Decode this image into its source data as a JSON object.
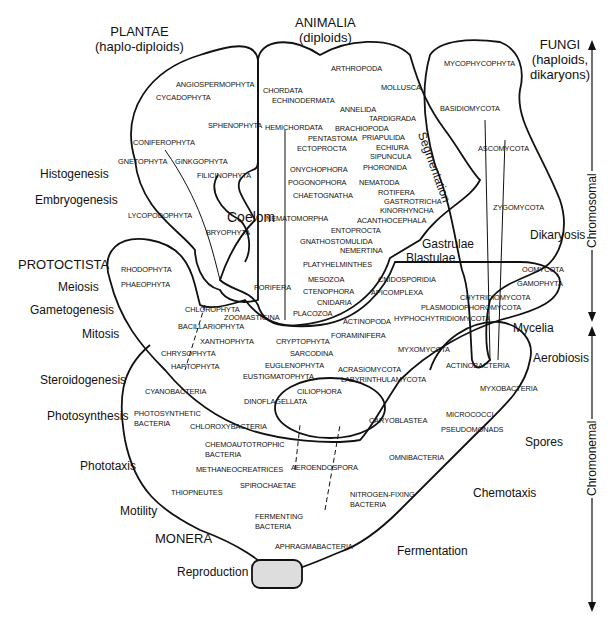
{
  "kingdoms": {
    "plantae": {
      "name": "PLANTAE",
      "ploidy": "(haplo-diploids)"
    },
    "animalia": {
      "name": "ANIMALIA",
      "ploidy": "(diploids)"
    },
    "fungi": {
      "name": "FUNGI",
      "ploidy1": "(haploids,",
      "ploidy2": "dikaryons)"
    },
    "protoctista": {
      "name": "PROTOCTISTA"
    },
    "monera": {
      "name": "MONERA"
    }
  },
  "processes_left": [
    "Histogenesis",
    "Embryogenesis",
    "Meiosis",
    "Gametogenesis",
    "Mitosis",
    "Steroidogenesis",
    "Photosynthesis",
    "Phototaxis",
    "Motility",
    "Reproduction"
  ],
  "processes_inner": {
    "coelom": "Coelom",
    "gastrulae": "Gastrulae",
    "blastulae": "Blastulae",
    "segmentation": "Segmentation",
    "dikaryosis": "Dikaryosis",
    "mycelia": "Mycelia",
    "aerobiosis": "Aerobiosis",
    "spores": "Spores",
    "chemotaxis": "Chemotaxis",
    "fermentation": "Fermentation"
  },
  "axis": {
    "upper": "Chromosomal",
    "lower": "Chromonemal"
  },
  "plantae_taxa": [
    "ANGIOSPERMOPHYTA",
    "CYCADOPHYTA",
    "SPHENOPHYTA",
    "CONIFEROPHYTA",
    "GNETOPHYTA",
    "GINKGOPHYTA",
    "FILICINOPHYTA",
    "LYCOPODOPHYTA",
    "BRYOPHYTA"
  ],
  "animalia_taxa": [
    "CHORDATA",
    "ECHINODERMATA",
    "ARTHROPODA",
    "MOLLUSCA",
    "ANNELIDA",
    "TARDIGRADA",
    "HEMICHORDATA",
    "BRACHIOPODA",
    "PENTASTOMA",
    "PRIAPULIDA",
    "ECTOPROCTA",
    "ECHIURA",
    "SIPUNCULA",
    "ONYCHOPHORA",
    "PHORONIDA",
    "POGONOPHORA",
    "NEMATODA",
    "CHAETOGNATHA",
    "ROTIFERA",
    "GASTROTRICHA",
    "NEMATOMORPHA",
    "KINORHYNCHA",
    "ACANTHOCEPHALA",
    "ENTOPROCTA",
    "GNATHOSTOMULIDA",
    "NEMERTINA",
    "PLATYHELMINTHES",
    "MESOZOA",
    "PORIFERA",
    "CTENOPHORA",
    "CNIDARIA",
    "PLACOZOA"
  ],
  "fungi_taxa": [
    "MYCOPHYCOPHYTA",
    "BASIDIOMYCOTA",
    "ASCOMYCOTA",
    "ZYGOMYCOTA"
  ],
  "protoctista_taxa": [
    "RHODOPHYTA",
    "PHAEOPHYTA",
    "CHLOROPHYTA",
    "ZOOMASTIGINA",
    "BACILLARIOPHYTA",
    "XANTHOPHYTA",
    "CHRYSOPHYTA",
    "HAPTOPHYTA",
    "CRYPTOPHYTA",
    "SARCODINA",
    "EUGLENOPHYTA",
    "EUSTIGMATOPHYTA",
    "CILIOPHORA",
    "DINOFLAGELLATA",
    "CNIDOSPORIDIA",
    "APICOMPLEXA",
    "OOMYCOTA",
    "GAMOPHYTA",
    "CHYTRIDIOMYCOTA",
    "PLASMODIOPHOROMYCOTA",
    "HYPHOCHYTRIDIOMYCOTA",
    "ACTINOPODA",
    "FORAMINIFERA",
    "MYXOMYCOTA",
    "ACRASIOMYCOTA",
    "LABYRINTHULAMYCOTA"
  ],
  "monera_taxa": [
    "CYANOBACTERIA",
    "PHOTOSYNTHETIC",
    "BACTERIA",
    "CHLOROXYBACTERIA",
    "CHEMOAUTOTROPHIC",
    "BACTERIA",
    "METHANEOCREATRICES",
    "AEROENDOSPORA",
    "SPIROCHAETAE",
    "THIOPNEUTES",
    "OMNIBACTERIA",
    "NITROGEN-FIXING",
    "BACTERIA",
    "FERMENTING",
    "BACTERIA",
    "APHRAGMABACTERIA",
    "CARYOBLASTEA",
    "ACTINOBACTERIA",
    "MYXOBACTERIA",
    "MICROCOCCI",
    "PSEUDOMONADS"
  ]
}
